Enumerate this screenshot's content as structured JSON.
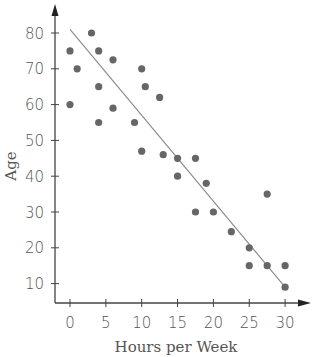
{
  "chart_data": {
    "type": "scatter",
    "title": "",
    "xlabel": "Hours per Week",
    "ylabel": "Age",
    "xlim": [
      0,
      30
    ],
    "ylim": [
      10,
      80
    ],
    "x_ticks": [
      0,
      5,
      10,
      15,
      20,
      25,
      30
    ],
    "y_ticks": [
      10,
      20,
      30,
      40,
      50,
      60,
      70,
      80
    ],
    "grid": false,
    "legend": null,
    "series": [
      {
        "name": "data",
        "points": [
          [
            0,
            75
          ],
          [
            0,
            60
          ],
          [
            1,
            70
          ],
          [
            3,
            80
          ],
          [
            4,
            75
          ],
          [
            4,
            65
          ],
          [
            4,
            55
          ],
          [
            6,
            72.5
          ],
          [
            6,
            59
          ],
          [
            9,
            55
          ],
          [
            10,
            70
          ],
          [
            10.5,
            65
          ],
          [
            10,
            47
          ],
          [
            12.5,
            62
          ],
          [
            13,
            46
          ],
          [
            15,
            45
          ],
          [
            15,
            40
          ],
          [
            17.5,
            45
          ],
          [
            17.5,
            30
          ],
          [
            19,
            38
          ],
          [
            20,
            30
          ],
          [
            22.5,
            24.5
          ],
          [
            25,
            20
          ],
          [
            25,
            15
          ],
          [
            27.5,
            35
          ],
          [
            27.5,
            15
          ],
          [
            30,
            15
          ],
          [
            30,
            9
          ]
        ]
      }
    ],
    "trend_line": {
      "x": [
        0,
        30
      ],
      "y": [
        81,
        9
      ]
    },
    "colors": {
      "points": "#666666",
      "line": "#888888",
      "axis": "#444444",
      "text": "#555555"
    }
  }
}
